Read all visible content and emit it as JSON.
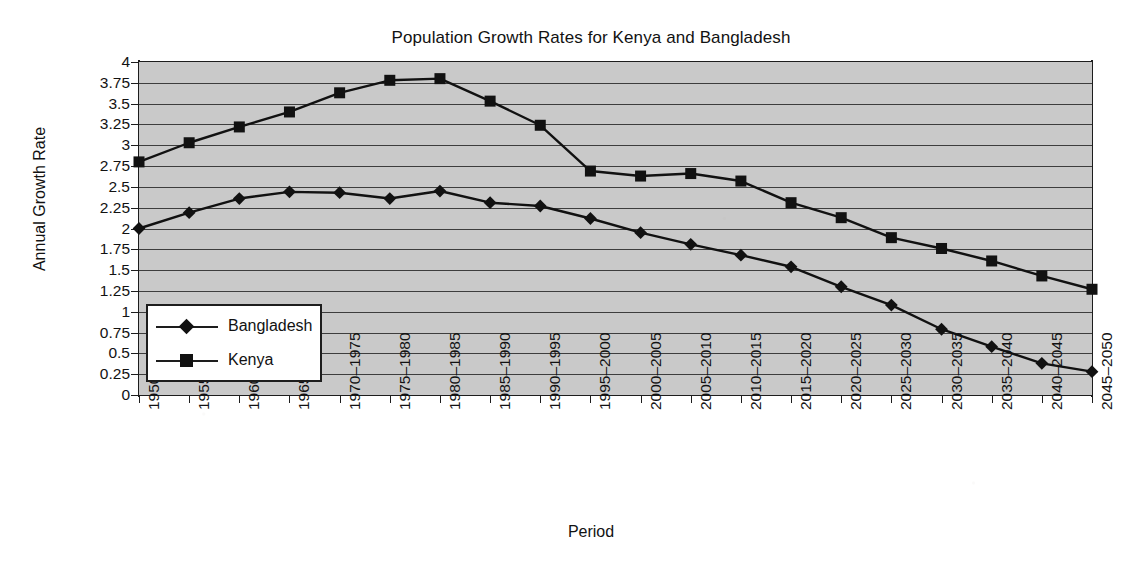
{
  "chart_data": {
    "type": "line",
    "title": "Population Growth Rates for Kenya and Bangladesh",
    "xlabel": "Period",
    "ylabel": "Annual Growth Rate",
    "ylim": [
      0,
      4
    ],
    "ytick_step": 0.25,
    "grid": true,
    "legend_position": "inside-left-lower",
    "plot_background": "#c9c9c9",
    "line_color": "#111111",
    "categories": [
      "1950–1955",
      "1955–1960",
      "1960–1965",
      "1965–1970",
      "1970–1975",
      "1975–1980",
      "1980–1985",
      "1985–1990",
      "1990–1995",
      "1995–2000",
      "2000–2005",
      "2005–2010",
      "2010–2015",
      "2015–2020",
      "2020–2025",
      "2025–2030",
      "2030–2035",
      "2035–2040",
      "2040–2045",
      "2045–2050"
    ],
    "yticks": [
      "0",
      "0.25",
      "0.5",
      "0.75",
      "1",
      "1.25",
      "1.5",
      "1.75",
      "2",
      "2.25",
      "2.5",
      "2.75",
      "3",
      "3.25",
      "3.5",
      "3.75",
      "4"
    ],
    "series": [
      {
        "name": "Bangladesh",
        "marker": "diamond",
        "values": [
          2.0,
          2.19,
          2.36,
          2.44,
          2.43,
          2.36,
          2.45,
          2.31,
          2.27,
          2.12,
          1.95,
          1.81,
          1.68,
          1.54,
          1.3,
          1.08,
          0.79,
          0.58,
          0.38,
          0.28
        ]
      },
      {
        "name": "Kenya",
        "marker": "square",
        "values": [
          2.8,
          3.03,
          3.22,
          3.4,
          3.63,
          3.78,
          3.8,
          3.53,
          3.24,
          2.69,
          2.63,
          2.66,
          2.57,
          2.31,
          2.13,
          1.89,
          1.76,
          1.61,
          1.43,
          1.27
        ]
      }
    ]
  },
  "legend": {
    "items": [
      {
        "label": "Bangladesh",
        "marker": "diamond"
      },
      {
        "label": "Kenya",
        "marker": "square"
      }
    ]
  }
}
